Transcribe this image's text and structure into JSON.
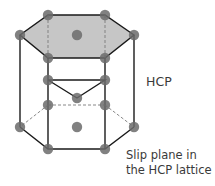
{
  "diagram": {
    "title": "HCP",
    "caption_line1": "Slip plane in",
    "caption_line2": "the HCP lattice",
    "colors": {
      "atom": "#6b6b6b",
      "slip_plane_fill": "#c6c6c6",
      "edge": "#1a1a1a",
      "hidden_edge": "#7a7a7a"
    },
    "atoms": {
      "top_layer": [
        [
          48,
          15
        ],
        [
          105,
          15
        ],
        [
          20,
          35
        ],
        [
          134,
          35
        ],
        [
          48,
          58
        ],
        [
          105,
          58
        ],
        [
          77,
          35
        ]
      ],
      "middle_layer": [
        [
          48,
          80
        ],
        [
          105,
          80
        ],
        [
          77,
          98
        ]
      ],
      "middle_back": [
        [
          48,
          105
        ],
        [
          105,
          105
        ]
      ],
      "bottom_layer": [
        [
          20,
          127
        ],
        [
          134,
          127
        ],
        [
          48,
          149
        ],
        [
          105,
          149
        ],
        [
          77,
          127
        ]
      ]
    }
  }
}
